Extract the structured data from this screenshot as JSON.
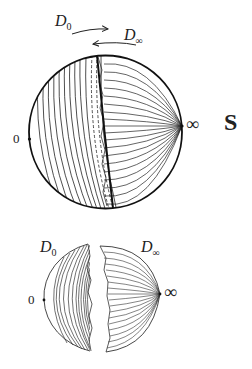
{
  "diagram": {
    "top_figure": {
      "labels": {
        "d0_main": "D",
        "d0_sub": "0",
        "dinf_main": "D",
        "dinf_sub": "∞",
        "zero_point": "0",
        "infinity_point": "∞",
        "sphere_name": "S"
      },
      "arrows": [
        {
          "from": "D0",
          "direction": "right"
        },
        {
          "from": "D∞",
          "direction": "left"
        }
      ]
    },
    "bottom_figure": {
      "labels": {
        "d0_main": "D",
        "d0_sub": "0",
        "dinf_main": "D",
        "dinf_sub": "∞",
        "zero_point": "0",
        "infinity_point": "∞"
      }
    },
    "colors": {
      "stroke": "#111111",
      "background": "#ffffff"
    }
  }
}
